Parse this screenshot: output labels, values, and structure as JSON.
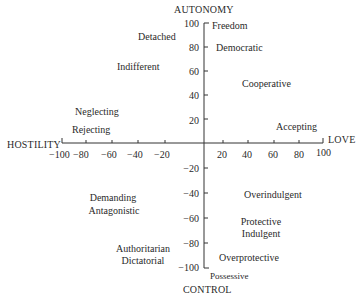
{
  "diagram": {
    "axes": {
      "top_title": "AUTONOMY",
      "bottom_title": "CONTROL",
      "left_title": "HOSTILITY",
      "right_title": "LOVE",
      "x_ticks_neg": [
        "−100",
        "−80",
        "−60",
        "−40",
        "−20"
      ],
      "x_ticks_pos": [
        "20",
        "40",
        "60",
        "80",
        "100"
      ],
      "y_ticks_pos": [
        "100",
        "80",
        "60",
        "40",
        "20"
      ],
      "y_ticks_neg": [
        "−20",
        "−40",
        "−60",
        "−80",
        "−100"
      ]
    },
    "labels": {
      "freedom": "Freedom",
      "democratic": "Democratic",
      "detached": "Detached",
      "indifferent": "Indifferent",
      "cooperative": "Cooperative",
      "neglecting": "Neglecting",
      "rejecting": "Rejecting",
      "accepting": "Accepting",
      "demanding": "Demanding",
      "antagonistic": "Antagonistic",
      "overindulgent": "Overindulgent",
      "protective": "Protective",
      "indulgent": "Indulgent",
      "authoritarian": "Authoritarian",
      "dictatorial": "Dictatorial",
      "overprotective": "Overprotective",
      "possessive": "Possessive"
    },
    "colors": {
      "ink": "#2a2a2a",
      "background": "#ffffff"
    }
  }
}
